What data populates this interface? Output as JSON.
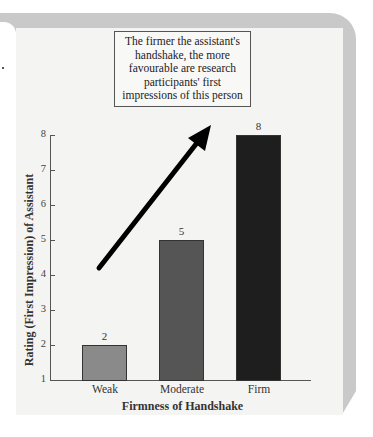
{
  "callout": {
    "text": "The firmer the assistant's handshake, the more favourable are research participants' first impressions of this person"
  },
  "chart_data": {
    "type": "bar",
    "title": "",
    "categories": [
      "Weak",
      "Moderate",
      "Firm"
    ],
    "values": [
      2,
      5,
      8
    ],
    "data_labels": [
      "2",
      "5",
      "8"
    ],
    "xlabel": "Firmness of Handshake",
    "ylabel": "Rating (First Impression) of Assistant",
    "ylim": [
      1,
      8
    ],
    "yticks": [
      "1",
      "2",
      "3",
      "4",
      "5",
      "6",
      "7",
      "8"
    ],
    "colors": [
      "#8a8a8a",
      "#555555",
      "#1e1e1e"
    ],
    "grid": false,
    "legend": null,
    "annotations": [
      {
        "type": "arrow",
        "direction": "up-right",
        "meaning": "increasing trend"
      },
      {
        "type": "text-box",
        "text": "The firmer the assistant's handshake, the more favourable are research participants' first impressions of this person"
      }
    ]
  }
}
